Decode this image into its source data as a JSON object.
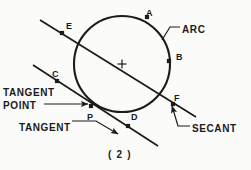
{
  "figure": {
    "caption": "( 2 )",
    "stroke_color": "#1b1b1b",
    "background_color": "#fbfbf9",
    "circle": {
      "cx": 122,
      "cy": 64,
      "r": 48
    },
    "center_mark": {
      "x": 122,
      "y": 64,
      "size": 9
    },
    "point_labels": [
      {
        "key": "a",
        "text": "A",
        "x": 146,
        "y": 9
      },
      {
        "key": "b",
        "text": "B",
        "x": 176,
        "y": 53
      },
      {
        "key": "c",
        "text": "C",
        "x": 52,
        "y": 70
      },
      {
        "key": "d",
        "text": "D",
        "x": 131,
        "y": 113
      },
      {
        "key": "e",
        "text": "E",
        "x": 66,
        "y": 22
      },
      {
        "key": "f",
        "text": "F",
        "x": 174,
        "y": 94
      },
      {
        "key": "p",
        "text": "P",
        "x": 87,
        "y": 113
      }
    ],
    "term_labels": [
      {
        "key": "arc",
        "text": "ARC",
        "x": 182,
        "y": 25
      },
      {
        "key": "tangent_point_line1",
        "text": "TANGENT",
        "x": 3,
        "y": 88
      },
      {
        "key": "tangent_point_line2",
        "text": "POINT",
        "x": 3,
        "y": 101
      },
      {
        "key": "tangent",
        "text": "TANGENT",
        "x": 19,
        "y": 123
      },
      {
        "key": "secant",
        "text": "SECANT",
        "x": 192,
        "y": 124
      }
    ],
    "dot_marks": [
      {
        "key": "mark-a",
        "x": 147,
        "y": 17
      },
      {
        "key": "mark-b",
        "x": 169,
        "y": 61
      },
      {
        "key": "mark-c",
        "x": 57,
        "y": 81
      },
      {
        "key": "mark-d",
        "x": 128,
        "y": 126
      },
      {
        "key": "mark-e",
        "x": 62,
        "y": 33
      },
      {
        "key": "mark-f",
        "x": 173,
        "y": 104
      },
      {
        "key": "mark-p",
        "x": 91,
        "y": 106
      }
    ],
    "secant_line": {
      "x1": 40,
      "y1": 20,
      "x2": 196,
      "y2": 117
    },
    "tangent_line": {
      "x1": 33,
      "y1": 65,
      "x2": 158,
      "y2": 146
    },
    "leaders": {
      "arc": "M 180 27 L 170 27 L 162 40",
      "tangent_point": "M 44 104 L 72 104 L 88 104",
      "tangent": "M 72 121 L 96 121 L 118 134",
      "secant": "M 190 126 L 178 126 L 172 106"
    }
  }
}
